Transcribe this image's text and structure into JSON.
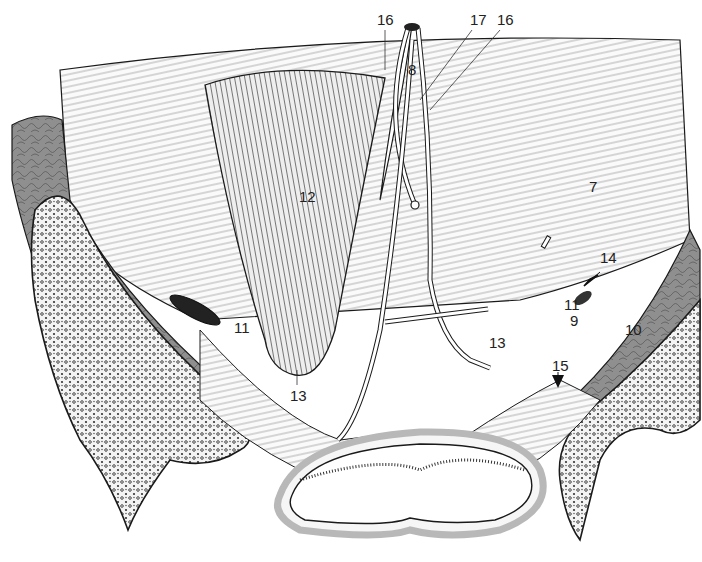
{
  "figure": {
    "type": "anatomical-illustration",
    "colors": {
      "line": "#1a1a1a",
      "muscle_fill": "#8f8f8f",
      "muscle_fill_light": "#a8a8a8",
      "bone_fill": "#f4f4f4",
      "background": "#ffffff",
      "rim_gray": "#b8b8b8"
    },
    "labels": [
      {
        "id": "16a",
        "text": "16",
        "x": 377,
        "y": 12
      },
      {
        "id": "17",
        "text": "17",
        "x": 470,
        "y": 12
      },
      {
        "id": "16b",
        "text": "16",
        "x": 497,
        "y": 12
      },
      {
        "id": "8",
        "text": "8",
        "x": 408,
        "y": 62
      },
      {
        "id": "12",
        "text": "12",
        "x": 299,
        "y": 189
      },
      {
        "id": "7",
        "text": "7",
        "x": 589,
        "y": 179
      },
      {
        "id": "14",
        "text": "14",
        "x": 600,
        "y": 250
      },
      {
        "id": "11a",
        "text": "11",
        "x": 564,
        "y": 297
      },
      {
        "id": "9",
        "text": "9",
        "x": 570,
        "y": 313
      },
      {
        "id": "10",
        "text": "10",
        "x": 625,
        "y": 322
      },
      {
        "id": "11b",
        "text": "11",
        "x": 234,
        "y": 320
      },
      {
        "id": "13a",
        "text": "13",
        "x": 489,
        "y": 335
      },
      {
        "id": "15",
        "text": "15",
        "x": 552,
        "y": 358
      },
      {
        "id": "13b",
        "text": "13",
        "x": 290,
        "y": 388
      }
    ]
  }
}
